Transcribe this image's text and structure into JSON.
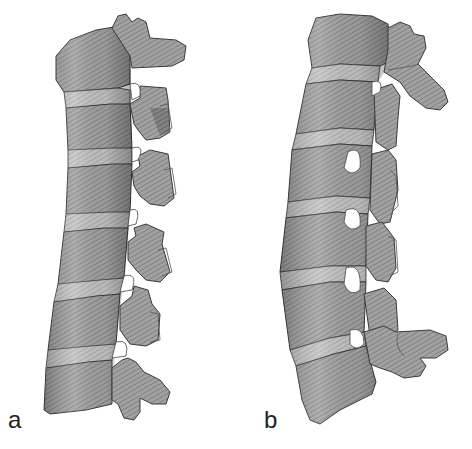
{
  "figure": {
    "colors": {
      "background": "#ffffff",
      "bone_base": "#9a9a9a",
      "bone_highlight": "#cfcfcf",
      "bone_shadow": "#555555",
      "outline": "#3a3a3a"
    },
    "panels": [
      {
        "id": "a",
        "label": "a",
        "vertebra_count": 6
      },
      {
        "id": "b",
        "label": "b",
        "vertebra_count": 6
      }
    ]
  }
}
